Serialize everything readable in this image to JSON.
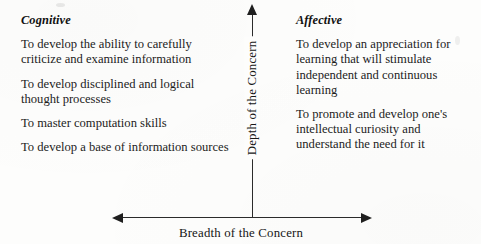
{
  "figure": {
    "type": "two-axis-quadrant-diagram",
    "background_color": "#fdfdfc",
    "ink_color": "#1a1a1a"
  },
  "axes": {
    "vertical": {
      "label": "Depth of the Concern",
      "arrow": "single-headed-up",
      "orientation": "rotated-90-ccw"
    },
    "horizontal": {
      "label": "Breadth of the Concern",
      "arrow": "double-headed"
    }
  },
  "quadrants": [
    {
      "id": "cognitive",
      "side": "left",
      "heading": "Cognitive",
      "items": [
        "To develop the ability to carefully criticize and examine information",
        "To develop disciplined and logical thought processes",
        "To master computation skills",
        "To develop a base of information sources"
      ]
    },
    {
      "id": "affective",
      "side": "right",
      "heading": "Affective",
      "items": [
        "To develop an appreciation for learning that will stimulate independent and continuous learning",
        "To promote and develop one's intellectual curiosity and understand the need for it"
      ]
    }
  ]
}
